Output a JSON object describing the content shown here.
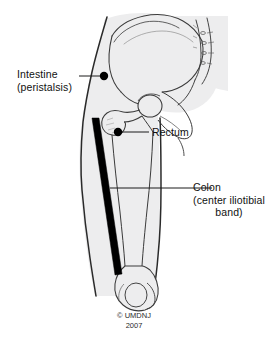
{
  "figure": {
    "background_color": "#ffffff",
    "body_fill_color": "#ededee",
    "outline_color": "#2a2a2a",
    "marker_color": "#000000",
    "band_color": "#000000"
  },
  "labels": {
    "intestine": {
      "line1": "Intestine",
      "line2": "(peristalsis)",
      "marker_x": 104,
      "marker_y": 76
    },
    "rectum": {
      "line1": "Rectum",
      "marker_x": 118,
      "marker_y": 132
    },
    "colon": {
      "line1": "Colon",
      "line2": "(center iliotibial",
      "line3": "band)",
      "leader_y": 188
    }
  },
  "copyright": {
    "line1": "© UMDNJ",
    "line2": "2007"
  },
  "anatomy": {
    "parts": [
      "iliac-crest",
      "ilium",
      "sacrum",
      "sacral-foramina",
      "pubis",
      "ischium",
      "femoral-head",
      "femoral-neck",
      "greater-trochanter",
      "femoral-shaft",
      "femoral-condyles",
      "thigh-outline",
      "iliotibial-band"
    ]
  }
}
